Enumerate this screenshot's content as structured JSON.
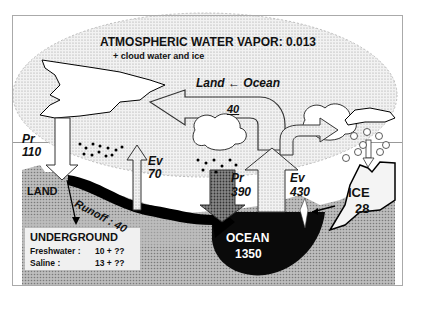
{
  "diagram": {
    "title": "ATMOSPHERIC WATER VAPOR: 0.013",
    "subtitle": "+ cloud water and ice",
    "transport_label": "Land ← Ocean",
    "transport_value": "40",
    "land_precip": {
      "label": "Pr",
      "value": "110"
    },
    "land_evap": {
      "label": "Ev",
      "value": "70"
    },
    "ocean_precip": {
      "label": "Pr",
      "value": "390"
    },
    "ocean_evap": {
      "label": "Ev",
      "value": "430"
    },
    "runoff": "Runoff : 40",
    "land_label": "LAND",
    "ocean": {
      "label": "OCEAN",
      "value": "1350"
    },
    "ice": {
      "label": "ICE",
      "value": "28"
    },
    "underground": {
      "title": "UNDERGROUND",
      "freshwater_label": "Freshwater :",
      "freshwater_value": "10 + ??",
      "saline_label": "Saline :",
      "saline_value": "13 + ??"
    },
    "colors": {
      "ocean": "#0a0a0a",
      "ground": "#a8a8a8",
      "atmosphere": "#e6e6e6",
      "arrow": "#cfcfcf"
    }
  }
}
